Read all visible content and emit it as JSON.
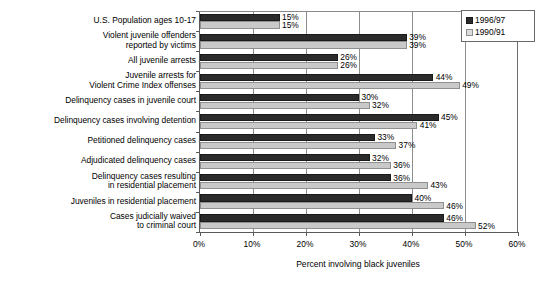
{
  "chart_data": {
    "type": "bar",
    "orientation": "horizontal",
    "title": "",
    "xlabel": "Percent involving black juveniles",
    "ylabel": "",
    "xlim": [
      0,
      60
    ],
    "xticks": [
      "0%",
      "10%",
      "20%",
      "30%",
      "40%",
      "50%",
      "60%"
    ],
    "xtick_values": [
      0,
      10,
      20,
      30,
      40,
      50,
      60
    ],
    "grid": true,
    "legend_position": "top-right",
    "categories": [
      "U.S. Population ages 10-17",
      "Violent juvenile offenders\nreported by victims",
      "All juvenile arrests",
      "Juvenile arrests for\nViolent Crime Index offenses",
      "Delinquency cases in juvenile court",
      "Delinquency cases involving detention",
      "Petitioned delinquency cases",
      "Adjudicated delinquency cases",
      "Delinquency cases resulting\nin residential placement",
      "Juveniles in residential placement",
      "Cases judicially waived\nto criminal court"
    ],
    "series": [
      {
        "name": "1996/97",
        "color": "#2b2b2b",
        "values": [
          15,
          39,
          26,
          44,
          30,
          45,
          33,
          32,
          36,
          40,
          46
        ],
        "labels": [
          "15%",
          "39%",
          "26%",
          "44%",
          "30%",
          "45%",
          "33%",
          "32%",
          "36%",
          "40%",
          "46%"
        ]
      },
      {
        "name": "1990/91",
        "color": "#c9c9c9",
        "values": [
          15,
          39,
          26,
          49,
          32,
          41,
          37,
          36,
          43,
          46,
          52
        ],
        "labels": [
          "15%",
          "39%",
          "26%",
          "49%",
          "32%",
          "41%",
          "37%",
          "36%",
          "43%",
          "46%",
          "52%"
        ]
      }
    ]
  },
  "legend": {
    "entries": [
      {
        "label": "1996/97",
        "swatch": "dark"
      },
      {
        "label": "1990/91",
        "swatch": "light"
      }
    ]
  }
}
